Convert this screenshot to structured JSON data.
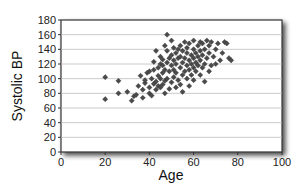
{
  "chart_data": {
    "type": "scatter",
    "title": "",
    "xlabel": "Age",
    "ylabel": "Systolic BP",
    "xlim": [
      0,
      100
    ],
    "ylim": [
      0,
      180
    ],
    "xticks": [
      0,
      20,
      40,
      60,
      80,
      100
    ],
    "yticks": [
      0,
      20,
      40,
      60,
      80,
      100,
      120,
      140,
      160,
      180
    ],
    "grid": {
      "horizontal": true,
      "vertical": false
    },
    "legend": null,
    "marker": {
      "shape": "diamond",
      "color": "#4a4a4a"
    },
    "points": [
      [
        20,
        102
      ],
      [
        20,
        72
      ],
      [
        26,
        97
      ],
      [
        26,
        80
      ],
      [
        30,
        82
      ],
      [
        32,
        70
      ],
      [
        33,
        76
      ],
      [
        34,
        78
      ],
      [
        35,
        90
      ],
      [
        36,
        104
      ],
      [
        37,
        74
      ],
      [
        37,
        85
      ],
      [
        38,
        94
      ],
      [
        38,
        98
      ],
      [
        39,
        108
      ],
      [
        40,
        80
      ],
      [
        40,
        88
      ],
      [
        40,
        110
      ],
      [
        41,
        77
      ],
      [
        41,
        100
      ],
      [
        42,
        93
      ],
      [
        42,
        112
      ],
      [
        42,
        123
      ],
      [
        43,
        85
      ],
      [
        43,
        96
      ],
      [
        43,
        138
      ],
      [
        44,
        90
      ],
      [
        44,
        104
      ],
      [
        44,
        115
      ],
      [
        45,
        88
      ],
      [
        45,
        100
      ],
      [
        45,
        120
      ],
      [
        45,
        130
      ],
      [
        46,
        92
      ],
      [
        46,
        108
      ],
      [
        46,
        118
      ],
      [
        46,
        126
      ],
      [
        47,
        80
      ],
      [
        47,
        97
      ],
      [
        47,
        112
      ],
      [
        47,
        145
      ],
      [
        48,
        100
      ],
      [
        48,
        122
      ],
      [
        48,
        138
      ],
      [
        48,
        160
      ],
      [
        49,
        86
      ],
      [
        49,
        110
      ],
      [
        49,
        128
      ],
      [
        50,
        95
      ],
      [
        50,
        118
      ],
      [
        50,
        132
      ],
      [
        50,
        152
      ],
      [
        51,
        102
      ],
      [
        51,
        112
      ],
      [
        51,
        125
      ],
      [
        51,
        142
      ],
      [
        52,
        88
      ],
      [
        52,
        120
      ],
      [
        52,
        135
      ],
      [
        52,
        108
      ],
      [
        53,
        98
      ],
      [
        53,
        128
      ],
      [
        53,
        140
      ],
      [
        54,
        92
      ],
      [
        54,
        115
      ],
      [
        54,
        130
      ],
      [
        54,
        145
      ],
      [
        55,
        82
      ],
      [
        55,
        105
      ],
      [
        55,
        122
      ],
      [
        55,
        138
      ],
      [
        56,
        110
      ],
      [
        56,
        128
      ],
      [
        56,
        150
      ],
      [
        57,
        100
      ],
      [
        57,
        118
      ],
      [
        57,
        135
      ],
      [
        57,
        142
      ],
      [
        58,
        90
      ],
      [
        58,
        112
      ],
      [
        58,
        125
      ],
      [
        58,
        148
      ],
      [
        59,
        105
      ],
      [
        59,
        120
      ],
      [
        59,
        132
      ],
      [
        60,
        98
      ],
      [
        60,
        115
      ],
      [
        60,
        128
      ],
      [
        60,
        140
      ],
      [
        60,
        152
      ],
      [
        61,
        110
      ],
      [
        61,
        122
      ],
      [
        61,
        135
      ],
      [
        62,
        118
      ],
      [
        62,
        130
      ],
      [
        62,
        145
      ],
      [
        63,
        105
      ],
      [
        63,
        125
      ],
      [
        63,
        138
      ],
      [
        63,
        150
      ],
      [
        64,
        115
      ],
      [
        64,
        132
      ],
      [
        64,
        148
      ],
      [
        65,
        96
      ],
      [
        65,
        120
      ],
      [
        65,
        140
      ],
      [
        66,
        128
      ],
      [
        66,
        152
      ],
      [
        67,
        110
      ],
      [
        67,
        135
      ],
      [
        67,
        145
      ],
      [
        68,
        118
      ],
      [
        68,
        150
      ],
      [
        69,
        130
      ],
      [
        70,
        140
      ],
      [
        70,
        120
      ],
      [
        71,
        148
      ],
      [
        72,
        125
      ],
      [
        73,
        135
      ],
      [
        74,
        150
      ],
      [
        75,
        148
      ],
      [
        76,
        128
      ],
      [
        77,
        125
      ]
    ]
  }
}
